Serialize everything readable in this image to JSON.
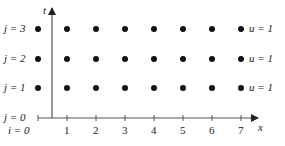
{
  "diagram": {
    "axes": {
      "horizontal_label": "x",
      "vertical_label": "t",
      "x_ticks": [
        "1",
        "2",
        "3",
        "4",
        "5",
        "6",
        "7"
      ],
      "origin_label_i": "i = 0",
      "origin_label_j": "j = 0"
    },
    "row_labels": [
      "j = 1",
      "j = 2",
      "j = 3"
    ],
    "boundary_labels": [
      "u = 1",
      "u = 1",
      "u = 1"
    ],
    "grid": {
      "columns": 8,
      "rows": 3,
      "dot_color": "#111111"
    }
  }
}
